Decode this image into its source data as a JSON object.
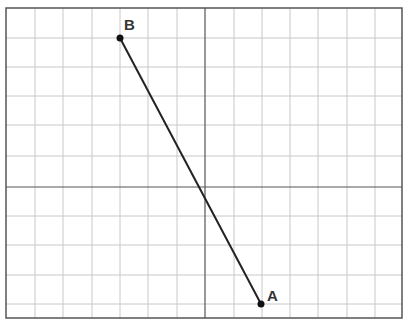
{
  "diagram": {
    "type": "coordinate-grid",
    "frame": {
      "x": 6,
      "y": 8,
      "width": 396,
      "height": 310
    },
    "grid": {
      "vertical_lines_x": [
        35,
        63,
        92,
        120,
        148,
        177,
        234,
        262,
        290,
        318,
        347,
        375
      ],
      "horizontal_lines_y": [
        38,
        67,
        96,
        125,
        156,
        216,
        245,
        275,
        304
      ],
      "color": "#c8c8c8"
    },
    "axes": {
      "x_axis_y": 187,
      "y_axis_x": 205,
      "color": "#555555"
    },
    "segment": {
      "from": "A",
      "to": "B",
      "color": "#222222"
    },
    "points": [
      {
        "label": "B",
        "x": 120,
        "y": 38,
        "label_dx": 4,
        "label_dy": -8
      },
      {
        "label": "A",
        "x": 261,
        "y": 304,
        "label_dx": 6,
        "label_dy": -3
      }
    ]
  }
}
